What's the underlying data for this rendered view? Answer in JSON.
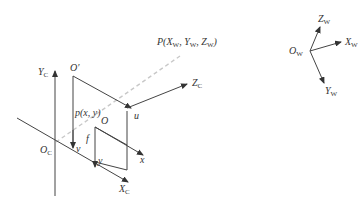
{
  "diagram": {
    "camera_frame": {
      "origin": "O",
      "origin_sub": "C",
      "axes": [
        {
          "name": "Y",
          "sub": "C"
        },
        {
          "name": "X",
          "sub": "C"
        },
        {
          "name": "Z",
          "sub": "C"
        }
      ]
    },
    "image_plane": {
      "pixel_origin": "O′",
      "pixel_axes": [
        "u",
        "v"
      ],
      "image_origin": "O",
      "image_axes": [
        "x",
        "y"
      ],
      "image_point": "p(x, y)",
      "focal_length": "f"
    },
    "world_point": {
      "label_prefix": "P(",
      "x": "X",
      "x_sub": "W",
      "y": "Y",
      "y_sub": "W",
      "z": "Z",
      "z_sub": "W",
      "label_suffix": ")"
    },
    "world_frame": {
      "origin": "O",
      "origin_sub": "W",
      "axes": [
        {
          "name": "Z",
          "sub": "W"
        },
        {
          "name": "X",
          "sub": "W"
        },
        {
          "name": "Y",
          "sub": "W"
        }
      ]
    },
    "colors": {
      "line": "#444444",
      "projection_ray": "#c8c8c8",
      "background": "#ffffff"
    }
  }
}
